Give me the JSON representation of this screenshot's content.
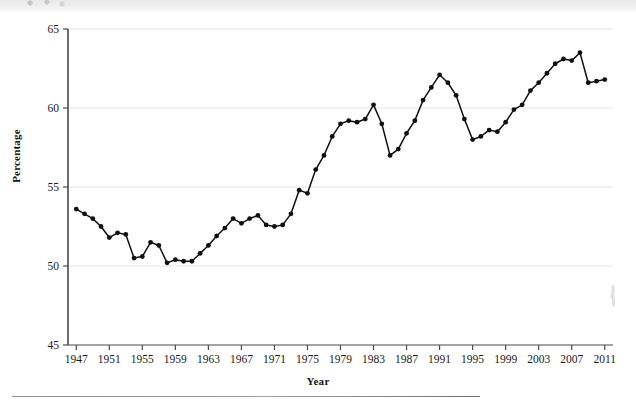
{
  "page": {
    "background_color": "#ffffff",
    "has_top_scan_band": true,
    "has_footer_rule": true
  },
  "chart_data": {
    "type": "line",
    "title": "",
    "subtitle": "",
    "xlabel": "Year",
    "ylabel": "Percentage",
    "xlim": [
      1946,
      2012
    ],
    "ylim": [
      45,
      65
    ],
    "ytick_values": [
      45,
      50,
      55,
      60,
      65
    ],
    "ytick_labels": [
      "45",
      "50",
      "55",
      "60",
      "65"
    ],
    "xtick_values": [
      1947,
      1951,
      1955,
      1959,
      1963,
      1967,
      1971,
      1975,
      1979,
      1983,
      1987,
      1991,
      1995,
      1999,
      2003,
      2007,
      2011
    ],
    "xtick_labels": [
      "1947",
      "1951",
      "1955",
      "1959",
      "1963",
      "1967",
      "1971",
      "1975",
      "1979",
      "1983",
      "1987",
      "1991",
      "1995",
      "1999",
      "2003",
      "2007",
      "2011"
    ],
    "grid": "horizontal-only",
    "grid_color": "#e4e4e4",
    "legend": null,
    "legend_position": "none",
    "line_color": "#101010",
    "marker": "circle",
    "marker_color": "#101010",
    "x": [
      1947,
      1948,
      1949,
      1950,
      1951,
      1952,
      1953,
      1954,
      1955,
      1956,
      1957,
      1958,
      1959,
      1960,
      1961,
      1962,
      1963,
      1964,
      1965,
      1966,
      1967,
      1968,
      1969,
      1970,
      1971,
      1972,
      1973,
      1974,
      1975,
      1976,
      1977,
      1978,
      1979,
      1980,
      1981,
      1982,
      1983,
      1984,
      1985,
      1986,
      1987,
      1988,
      1989,
      1990,
      1991,
      1992,
      1993,
      1994,
      1995,
      1996,
      1997,
      1998,
      1999,
      2000,
      2001,
      2002,
      2003,
      2004,
      2005,
      2006,
      2007,
      2008,
      2009,
      2010,
      2011
    ],
    "values": [
      53.6,
      53.3,
      53.0,
      52.5,
      51.8,
      52.1,
      52.0,
      50.5,
      50.6,
      51.5,
      51.3,
      50.2,
      50.4,
      50.3,
      50.3,
      50.8,
      51.3,
      51.9,
      52.4,
      53.0,
      52.7,
      53.0,
      53.2,
      52.6,
      52.5,
      52.6,
      53.3,
      54.8,
      54.6,
      56.1,
      57.0,
      58.2,
      59.0,
      59.2,
      59.1,
      59.3,
      60.2,
      59.0,
      57.0,
      57.4,
      58.4,
      59.2,
      60.5,
      61.3,
      62.1,
      61.6,
      60.8,
      59.3,
      58.0,
      58.2,
      58.6,
      58.5,
      59.1,
      59.9,
      60.2,
      61.1,
      61.6,
      62.2,
      62.8,
      63.1,
      63.0,
      63.5,
      61.6,
      61.7,
      61.8
    ],
    "n_points": 65
  }
}
